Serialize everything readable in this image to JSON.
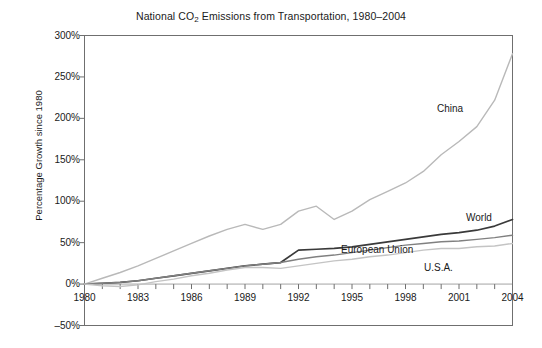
{
  "chart_data": {
    "type": "line",
    "title": "National CO2 Emissions from Transportation, 1980–2004",
    "title_prefix": "National CO",
    "title_sub": "2",
    "title_suffix": " Emissions from Transportation, 1980–2004",
    "xlabel": "",
    "ylabel": "Percentage Growth since 1980",
    "xlim": [
      1980,
      2004
    ],
    "ylim": [
      -50,
      300
    ],
    "grid": false,
    "legend_position": "inline-annotations",
    "y_ticks": [
      -50,
      0,
      50,
      100,
      150,
      200,
      250,
      300
    ],
    "y_tick_labels": [
      "–50%",
      "0%",
      "50%",
      "100%",
      "150%",
      "200%",
      "250%",
      "300%"
    ],
    "x_ticks": [
      1980,
      1983,
      1986,
      1989,
      1992,
      1995,
      1998,
      2001,
      2004
    ],
    "x_tick_labels": [
      "1980",
      "1983",
      "1986",
      "1989",
      "1992",
      "1995",
      "1998",
      "2001",
      "2004"
    ],
    "x_minor_ticks": [
      1980,
      1981,
      1982,
      1983,
      1984,
      1985,
      1986,
      1987,
      1988,
      1989,
      1990,
      1991,
      1992,
      1993,
      1994,
      1995,
      1996,
      1997,
      1998,
      1999,
      2000,
      2001,
      2002,
      2003,
      2004
    ],
    "x": [
      1980,
      1981,
      1982,
      1983,
      1984,
      1985,
      1986,
      1987,
      1988,
      1989,
      1990,
      1991,
      1992,
      1993,
      1994,
      1995,
      1996,
      1997,
      1998,
      1999,
      2000,
      2001,
      2002,
      2003,
      2004
    ],
    "series": [
      {
        "name": "China",
        "label": "China",
        "color": "#b9b9b9",
        "width": 1.4,
        "label_x": 437,
        "label_y": 103,
        "values": [
          0,
          7,
          14,
          22,
          31,
          40,
          49,
          58,
          66,
          72,
          66,
          72,
          88,
          94,
          78,
          88,
          102,
          112,
          122,
          136,
          156,
          172,
          190,
          222,
          278
        ]
      },
      {
        "name": "World",
        "label": "World",
        "color": "#3a3a3a",
        "width": 1.7,
        "label_x": 466,
        "label_y": 212,
        "values": [
          0,
          1,
          2,
          4,
          7,
          10,
          13,
          16,
          19,
          22,
          24,
          26,
          41,
          42,
          43,
          45,
          48,
          51,
          54,
          57,
          60,
          62,
          65,
          70,
          78
        ]
      },
      {
        "name": "European Union",
        "label": "European Union",
        "color": "#808080",
        "width": 1.4,
        "label_x": 341,
        "label_y": 244,
        "values": [
          0,
          1,
          2,
          4,
          7,
          10,
          13,
          16,
          19,
          22,
          24,
          26,
          30,
          33,
          35,
          38,
          41,
          44,
          47,
          49,
          51,
          52,
          54,
          56,
          59
        ]
      },
      {
        "name": "U.S.A.",
        "label": "U.S.A.",
        "color": "#c4c4c4",
        "width": 1.4,
        "label_x": 424,
        "label_y": 262,
        "values": [
          0,
          -2,
          -3,
          -1,
          3,
          6,
          10,
          13,
          17,
          20,
          20,
          19,
          22,
          25,
          28,
          30,
          33,
          35,
          38,
          41,
          43,
          43,
          45,
          46,
          49
        ]
      }
    ]
  }
}
